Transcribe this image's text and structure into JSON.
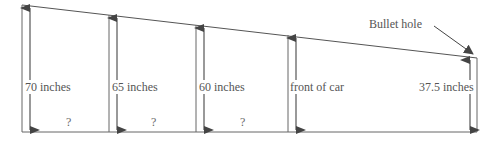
{
  "diagram": {
    "colors": {
      "line": "#555555",
      "arrow": "#444444",
      "text": "#555555"
    },
    "labels": {
      "h1": "70 inches",
      "h2": "65 inches",
      "h3": "60 inches",
      "h4": "front of car",
      "h5": "37.5 inches",
      "bullet_hole": "Bullet hole"
    },
    "unknowns": [
      "?",
      "?",
      "?"
    ]
  }
}
